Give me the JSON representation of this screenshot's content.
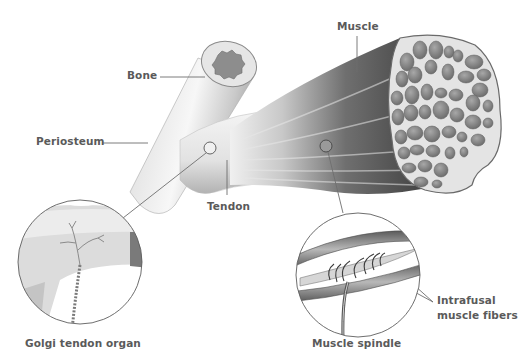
{
  "diagram": {
    "type": "anatomical-illustration",
    "labels": {
      "bone": "Bone",
      "periosteum": "Periosteum",
      "muscle": "Muscle",
      "tendon": "Tendon",
      "golgi_tendon_organ": "Golgi tendon organ",
      "muscle_spindle": "Muscle spindle",
      "intrafusal_line1": "Intrafusal",
      "intrafusal_line2": "muscle fibers"
    },
    "insets": [
      {
        "name": "golgi-tendon-organ-inset",
        "caption": "Golgi tendon organ"
      },
      {
        "name": "muscle-spindle-inset",
        "caption": "Muscle spindle"
      }
    ],
    "colors": {
      "label_text": "#5a5a5a",
      "leader_line": "#6e6e6e",
      "bone_light": "#f2f2f2",
      "bone_shade": "#b5b5b5",
      "muscle_dark": "#3c3c3c",
      "muscle_mid": "#7a7a7a",
      "fascicle": "#8c8c8c",
      "fascicle_bg": "#d9d9d9"
    }
  }
}
